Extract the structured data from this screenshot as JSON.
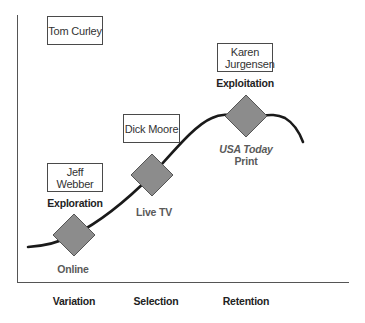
{
  "diagram": {
    "type": "evolutionary-s-curve",
    "people": [
      {
        "id": "tom",
        "name": "Tom Curley"
      },
      {
        "id": "karen",
        "name": "Karen Jurgensen"
      },
      {
        "id": "dick",
        "name": "Dick Moore"
      },
      {
        "id": "jeff",
        "name": "Jeff Webber"
      }
    ],
    "phases": {
      "exploration": "Exploration",
      "exploitation": "Exploitation"
    },
    "nodes": [
      {
        "id": "online",
        "label": "Online"
      },
      {
        "id": "livetv",
        "label": "Live TV"
      },
      {
        "id": "print",
        "label_line1": "USA Today",
        "label_line2": "Print"
      }
    ],
    "x_axis_labels": [
      "Variation",
      "Selection",
      "Retention"
    ],
    "colors": {
      "axis": "#555555",
      "curve": "#1a1a1a",
      "diamond_fill": "#8c8c8c",
      "diamond_stroke": "#555555",
      "box_border": "#4a4a4a"
    }
  }
}
